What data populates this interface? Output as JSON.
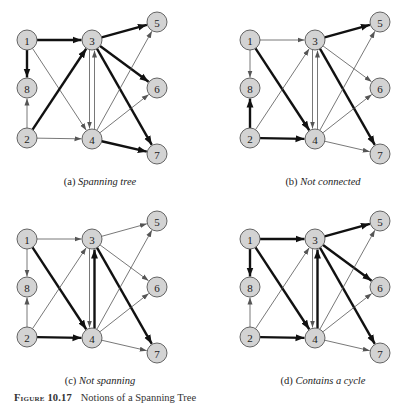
{
  "figure": {
    "number": "Figure 10.17",
    "title": "Notions of a Spanning Tree"
  },
  "graph": {
    "node_fill": "#d3d3d3",
    "node_stroke": "#555555",
    "edge_color_thin": "#555555",
    "edge_color_thick": "#111111",
    "nodes": [
      {
        "id": "1",
        "x": 27,
        "y": 40
      },
      {
        "id": "3",
        "x": 92,
        "y": 40
      },
      {
        "id": "5",
        "x": 157,
        "y": 22
      },
      {
        "id": "8",
        "x": 27,
        "y": 88
      },
      {
        "id": "6",
        "x": 157,
        "y": 88
      },
      {
        "id": "2",
        "x": 27,
        "y": 138
      },
      {
        "id": "4",
        "x": 92,
        "y": 139
      },
      {
        "id": "7",
        "x": 157,
        "y": 154
      }
    ],
    "edges": [
      {
        "from": "1",
        "to": "3"
      },
      {
        "from": "1",
        "to": "8"
      },
      {
        "from": "1",
        "to": "4"
      },
      {
        "from": "2",
        "to": "8"
      },
      {
        "from": "2",
        "to": "3"
      },
      {
        "from": "2",
        "to": "4"
      },
      {
        "from": "3",
        "to": "4",
        "offset": -2.5
      },
      {
        "from": "4",
        "to": "3",
        "offset": 2.5
      },
      {
        "from": "3",
        "to": "5"
      },
      {
        "from": "3",
        "to": "6"
      },
      {
        "from": "3",
        "to": "7"
      },
      {
        "from": "4",
        "to": "5"
      },
      {
        "from": "4",
        "to": "6"
      },
      {
        "from": "4",
        "to": "7"
      }
    ]
  },
  "panels": [
    {
      "tag": "(a)",
      "title": "Spanning tree",
      "offset_x": 0,
      "offset_y": 0,
      "thick_edges": [
        "1-3",
        "1-8",
        "2-3",
        "3-5",
        "3-6",
        "3-7",
        "4-7"
      ]
    },
    {
      "tag": "(b)",
      "title": "Not connected",
      "offset_x": 223,
      "offset_y": 0,
      "thick_edges": [
        "1-4",
        "2-8",
        "2-4",
        "3-5",
        "3-7"
      ]
    },
    {
      "tag": "(c)",
      "title": "Not spanning",
      "offset_x": 0,
      "offset_y": 199,
      "thick_edges": [
        "1-4",
        "2-4",
        "4-3",
        "3-7"
      ]
    },
    {
      "tag": "(d)",
      "title": "Contains a cycle",
      "offset_x": 223,
      "offset_y": 199,
      "thick_edges": [
        "1-3",
        "1-8",
        "1-4",
        "2-4",
        "4-3",
        "3-5",
        "3-6",
        "3-7"
      ]
    }
  ]
}
